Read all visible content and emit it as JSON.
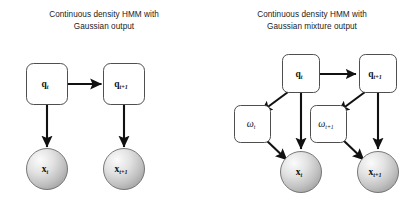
{
  "figure": {
    "background_color": "#ffffff",
    "stroke_color": "#111111",
    "box_fill": "#ffffff",
    "box_stroke": "#3b3b3b",
    "circle_fill_light": "#f2f2f2",
    "circle_fill_dark": "#a8a8a8",
    "circle_stroke": "#6b6b6b",
    "text_color": "#222222"
  },
  "panels": [
    {
      "id": "left",
      "title": "Continuous density HMM with\nGaussian output",
      "nodes": [
        {
          "id": "q_t",
          "type": "box",
          "label": "q",
          "subscript": "t",
          "x": 47,
          "y": 84
        },
        {
          "id": "q_t1",
          "type": "box",
          "label": "q",
          "subscript": "t+1",
          "x": 124,
          "y": 84
        },
        {
          "id": "x_t",
          "type": "circle",
          "label": "x",
          "subscript": "t",
          "x": 47,
          "y": 169
        },
        {
          "id": "x_t1",
          "type": "circle",
          "label": "x",
          "subscript": "t+1",
          "x": 124,
          "y": 169
        }
      ],
      "edges": [
        {
          "from": "q_t",
          "to": "q_t1",
          "kind": "horizontal"
        },
        {
          "from": "q_t",
          "to": "x_t",
          "kind": "vertical"
        },
        {
          "from": "q_t1",
          "to": "x_t1",
          "kind": "vertical"
        }
      ]
    },
    {
      "id": "right",
      "title": "Continuous density HMM with\nGaussian mixture output",
      "nodes": [
        {
          "id": "q_t",
          "type": "box",
          "label": "q",
          "subscript": "t",
          "x": 93,
          "y": 74
        },
        {
          "id": "q_t1",
          "type": "box",
          "label": "q",
          "subscript": "t+1",
          "x": 170,
          "y": 74
        },
        {
          "id": "w_t",
          "type": "box",
          "label": "ω",
          "subscript": "t",
          "x": 44,
          "y": 124
        },
        {
          "id": "w_t1",
          "type": "box",
          "label": "ω",
          "subscript": "t+1",
          "x": 120,
          "y": 124
        },
        {
          "id": "x_t",
          "type": "circle",
          "label": "x",
          "subscript": "t",
          "x": 93,
          "y": 172
        },
        {
          "id": "x_t1",
          "type": "circle",
          "label": "x",
          "subscript": "t+1",
          "x": 170,
          "y": 172
        }
      ],
      "edges": [
        {
          "from": "q_t",
          "to": "q_t1",
          "kind": "horizontal"
        },
        {
          "from": "q_t",
          "to": "w_t",
          "kind": "diagonal"
        },
        {
          "from": "q_t",
          "to": "x_t",
          "kind": "vertical"
        },
        {
          "from": "w_t",
          "to": "x_t",
          "kind": "diagonal"
        },
        {
          "from": "q_t1",
          "to": "w_t1",
          "kind": "diagonal"
        },
        {
          "from": "q_t1",
          "to": "x_t1",
          "kind": "vertical"
        },
        {
          "from": "w_t1",
          "to": "x_t1",
          "kind": "diagonal"
        }
      ]
    }
  ]
}
